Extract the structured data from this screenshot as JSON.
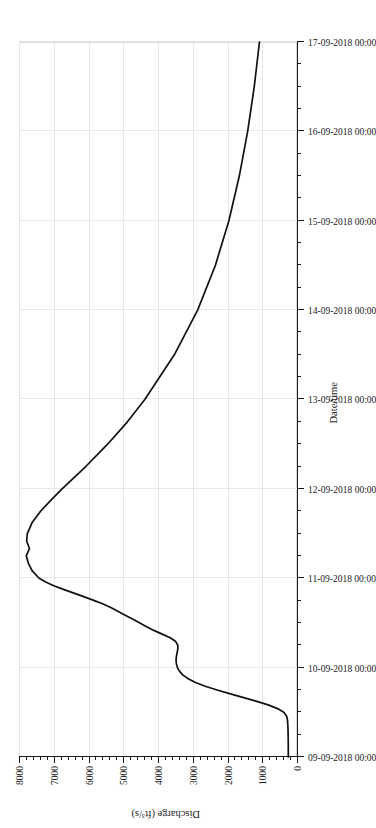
{
  "chart_data": {
    "type": "line",
    "title": "",
    "xlabel": "Date/time",
    "ylabel": "Discharge (ft³/s)",
    "orientation": "page-rotated-90-ccw",
    "grid": true,
    "legend": null,
    "xlim": [
      "09-09-2018 00:00",
      "17-09-2018 00:00"
    ],
    "ylim": [
      0,
      8000
    ],
    "x_tick_labels": [
      "09-09-2018 00:00",
      "10-09-2018 00:00",
      "11-09-2018 00:00",
      "12-09-2018 00:00",
      "13-09-2018 00:00",
      "14-09-2018 00:00",
      "15-09-2018 00:00",
      "16-09-2018 00:00",
      "17-09-2018 00:00"
    ],
    "x_minor_ticks_per_interval": 3,
    "y_tick_labels": [
      "0",
      "1000",
      "2000",
      "3000",
      "4000",
      "5000",
      "6000",
      "7000",
      "8000"
    ],
    "y_tick_values": [
      0,
      1000,
      2000,
      3000,
      4000,
      5000,
      6000,
      7000,
      8000
    ],
    "y_minor_ticks_per_interval": 4,
    "series": [
      {
        "name": "Discharge",
        "color": "#111111",
        "x_hours_from_start": [
          0,
          2,
          4,
          6,
          8,
          10,
          11,
          12,
          13,
          14,
          15,
          16,
          17,
          18,
          19,
          20,
          21,
          22,
          23,
          24,
          25,
          26,
          27,
          28,
          29,
          30,
          31,
          32,
          33,
          34,
          35,
          36,
          37,
          38,
          39,
          40,
          41,
          42,
          43,
          44,
          45,
          46,
          47,
          48,
          50,
          52,
          54,
          56,
          58,
          60,
          63,
          66,
          69,
          72,
          78,
          84,
          90,
          96,
          108,
          120,
          132,
          144,
          156,
          168,
          180,
          192
        ],
        "y_discharge": [
          250,
          250,
          252,
          255,
          260,
          275,
          300,
          380,
          560,
          830,
          1180,
          1560,
          1940,
          2300,
          2640,
          2920,
          3130,
          3280,
          3380,
          3440,
          3470,
          3480,
          3470,
          3450,
          3430,
          3430,
          3490,
          3650,
          3880,
          4120,
          4330,
          4520,
          4720,
          4930,
          5130,
          5330,
          5560,
          5830,
          6120,
          6420,
          6720,
          7000,
          7230,
          7420,
          7620,
          7730,
          7790,
          7700,
          7780,
          7760,
          7620,
          7380,
          7080,
          6760,
          6080,
          5450,
          4880,
          4380,
          3530,
          2860,
          2350,
          1960,
          1660,
          1420,
          1230,
          1080
        ],
        "peak_discharge": 7790,
        "peak_time": "10-09-2018 18:00",
        "baseflow_start": 250,
        "final_discharge": 1080
      }
    ]
  },
  "axes": {
    "x_title": "Date/time",
    "y_title": "Discharge (ft³/s)"
  },
  "colors": {
    "line": "#111111",
    "grid": "#e6e6e6",
    "axis": "#1a1a1a",
    "background": "#ffffff"
  }
}
